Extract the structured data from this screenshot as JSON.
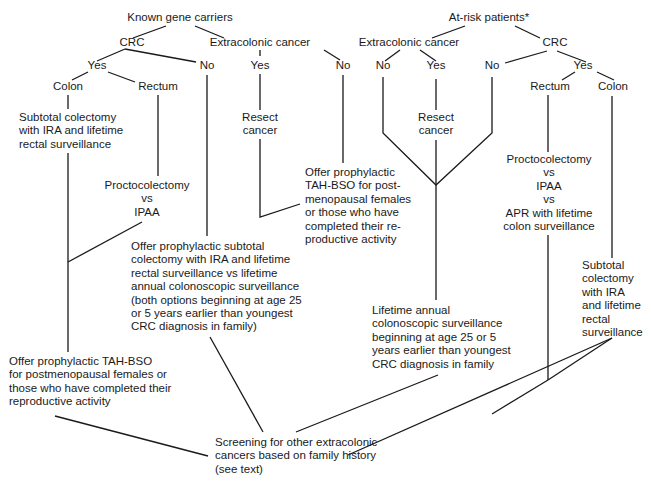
{
  "diagram": {
    "roots": {
      "known": "Known gene carriers",
      "atrisk": "At-risk patients*"
    },
    "left": {
      "crc": "CRC",
      "extra": "Extracolonic cancer",
      "crc_yes": "Yes",
      "crc_no": "No",
      "extra_yes": "Yes",
      "extra_no": "No",
      "colon": "Colon",
      "rectum": "Rectum",
      "subtotal": "Subtotal colectomy\nwith IRA and lifetime\nrectal surveillance",
      "procto": "Proctocolectomy\nvs\nIPAA",
      "resect": "Resect\ncancer",
      "tah_short": "Offer prophylactic\nTAH-BSO for post-\nmenopausal females\nor those who have\ncompleted their re-\nproductive activity",
      "prophylactic": "Offer prophylactic subtotal\ncolectomy with IRA and lifetime\nrectal surveillance vs lifetime\nannual colonoscopic surveillance\n(both options beginning at age 25\nor 5 years earlier than youngest\nCRC diagnosis in family)",
      "tah_long": "Offer prophylactic TAH-BSO\nfor postmenopausal females or\nthose who have completed their\nreproductive activity"
    },
    "right": {
      "extra": "Extracolonic cancer",
      "crc": "CRC",
      "extra_no": "No",
      "extra_yes": "Yes",
      "crc_no": "No",
      "crc_yes": "Yes",
      "rectum": "Rectum",
      "colon": "Colon",
      "resect": "Resect\ncancer",
      "procto": "Proctocolectomy\nvs\nIPAA\nvs\nAPR with lifetime\ncolon surveillance",
      "subtotal": "Subtotal\ncolectomy\nwith IRA\nand lifetime\nrectal\nsurveillance",
      "annual": "Lifetime annual\ncolonoscopic surveillance\nbeginning at age 25 or 5\nyears earlier than youngest\nCRC diagnosis in family"
    },
    "final": "Screening for other extracolonic\ncancers based on family history\n(see text)"
  }
}
